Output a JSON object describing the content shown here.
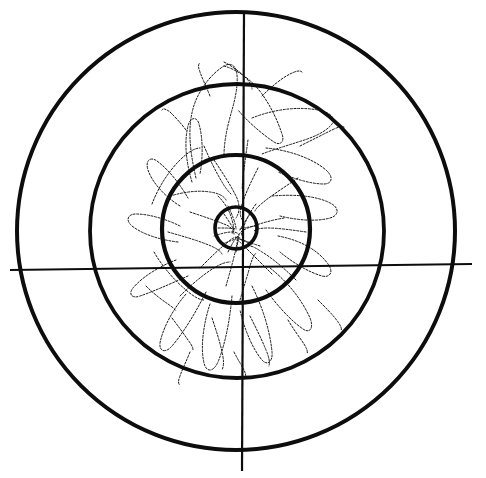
{
  "figure": {
    "kind": "bullseye-target-diagram",
    "width": 486,
    "height": 478,
    "background_color": "#ffffff",
    "ink_color": "#0d0d0d",
    "pattern_color": "#1a1a1a",
    "title": "",
    "caption": ""
  },
  "chart_data": {
    "type": "scatter",
    "title": "",
    "subtitle": "",
    "xlabel": "",
    "ylabel": "",
    "grid": false,
    "legend_position": "none",
    "axis_style": "crosshair",
    "xlim": [
      -250,
      250
    ],
    "ylim": [
      -250,
      250
    ],
    "center": {
      "x": 236,
      "y": 228
    },
    "crosshair": {
      "vertical": {
        "x_top": 244,
        "y_top": 12,
        "x_bottom": 242,
        "y_bottom": 471,
        "stroke_width": 2.2
      },
      "horizontal": {
        "x_left": 10,
        "y_left": 270,
        "x_right": 472,
        "y_right": 264,
        "stroke_width": 2.2
      }
    },
    "rings": [
      {
        "name": "ring-outer",
        "index": 1,
        "radius": 219,
        "stroke_width": 4.0,
        "score": 1
      },
      {
        "name": "ring-middle",
        "index": 2,
        "radius": 147,
        "stroke_width": 3.8,
        "score": 2
      },
      {
        "name": "ring-inner",
        "index": 3,
        "radius": 74,
        "stroke_width": 4.2,
        "score": 3
      },
      {
        "name": "ring-bull",
        "index": 4,
        "radius": 21,
        "stroke_width": 3.6,
        "score": 4
      }
    ],
    "dispersion_pattern": {
      "name": "shot-dispersion-trace",
      "description": "irregular star-shaped hand-traced dispersion contour overlaying the central rings",
      "stroke_width": 1.0,
      "stroke_dasharray": "2 1.6",
      "bounding_box": {
        "x": 152,
        "y": 62,
        "width": 190,
        "height": 320
      },
      "lobes": 9
    }
  }
}
